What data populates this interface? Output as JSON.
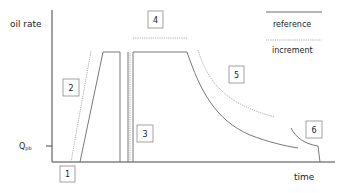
{
  "diagram": {
    "y_axis_label": "oil rate",
    "x_axis_label": "time",
    "q_label_main": "Q",
    "q_label_sub": "pb",
    "legend": {
      "reference": "reference",
      "increment": "increment"
    },
    "phase_boxes": [
      {
        "id": "1",
        "label": "1"
      },
      {
        "id": "2",
        "label": "2"
      },
      {
        "id": "3",
        "label": "3"
      },
      {
        "id": "4",
        "label": "4"
      },
      {
        "id": "5",
        "label": "5"
      },
      {
        "id": "6",
        "label": "6"
      }
    ],
    "colors": {
      "reference_line": "#6a6a6a",
      "increment_line": "#9a9a9a",
      "axis": "#444444"
    }
  }
}
